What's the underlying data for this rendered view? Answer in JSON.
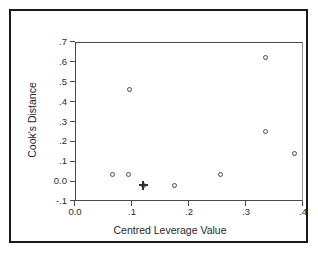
{
  "chart_data": {
    "type": "scatter",
    "title": "",
    "xlabel": "Centred Leverage Value",
    "ylabel": "Cook's Distance",
    "xlim": [
      0.0,
      0.4
    ],
    "ylim": [
      -0.1,
      0.7
    ],
    "grid": false,
    "legend": null,
    "xticks": [
      "0.0",
      ".1",
      ".2",
      ".3",
      ".4"
    ],
    "xtick_values": [
      0.0,
      0.1,
      0.2,
      0.3,
      0.4
    ],
    "yticks": [
      "-.1",
      "0.0",
      ".1",
      ".2",
      ".3",
      ".4",
      ".5",
      ".6",
      ".7"
    ],
    "ytick_values": [
      -0.1,
      0.0,
      0.1,
      0.2,
      0.3,
      0.4,
      0.5,
      0.6,
      0.7
    ],
    "marker": "open-circle",
    "marker_color": "#4d4d4d",
    "points": [
      {
        "x": 0.065,
        "y": 0.035,
        "marker": "open-circle"
      },
      {
        "x": 0.093,
        "y": 0.035,
        "marker": "open-circle"
      },
      {
        "x": 0.095,
        "y": 0.46,
        "marker": "open-circle"
      },
      {
        "x": 0.12,
        "y": -0.02,
        "marker": "cross"
      },
      {
        "x": 0.175,
        "y": -0.02,
        "marker": "open-circle"
      },
      {
        "x": 0.255,
        "y": 0.035,
        "marker": "open-circle"
      },
      {
        "x": 0.335,
        "y": 0.62,
        "marker": "open-circle"
      },
      {
        "x": 0.335,
        "y": 0.25,
        "marker": "open-circle"
      },
      {
        "x": 0.385,
        "y": 0.14,
        "marker": "open-circle"
      }
    ]
  },
  "figure": {
    "border_color": "#1a1a1a",
    "axis_color": "#4a4a4a",
    "background": "#ffffff"
  }
}
